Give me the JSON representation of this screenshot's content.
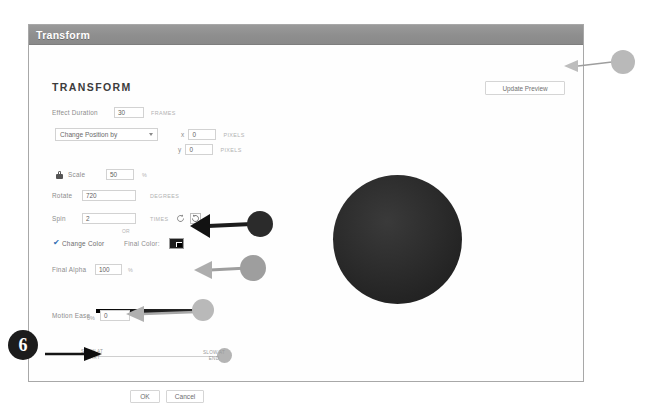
{
  "window": {
    "title": "Transform",
    "section_heading": "TRANSFORM",
    "update_preview_label": "Update Preview"
  },
  "fields": {
    "effect_duration": {
      "label": "Effect Duration",
      "value": "30",
      "unit": "FRAMES"
    },
    "change_position": {
      "dropdown_label": "Change Position by",
      "dropdown_icon": "chevron-down-icon",
      "x": {
        "axis": "x",
        "value": "0",
        "unit": "PIXELS"
      },
      "y": {
        "axis": "y",
        "value": "0",
        "unit": "PIXELS"
      }
    },
    "scale": {
      "lock_icon": "lock-icon",
      "label": "Scale",
      "value": "50",
      "unit": "%"
    },
    "rotate": {
      "label": "Rotate",
      "value": "720",
      "unit": "DEGREES"
    },
    "or_text": "OR",
    "spin": {
      "label": "Spin",
      "value": "2",
      "unit": "TIMES",
      "ccw_icon": "rotate-counterclockwise-icon",
      "cw_icon": "rotate-clockwise-icon"
    },
    "change_color": {
      "checkbox_checked": true,
      "checkbox_glyph": "✔",
      "label": "Change Color",
      "final_color_label": "Final Color:",
      "swatch_color": "#1e1e1e"
    },
    "final_alpha": {
      "label": "Final Alpha",
      "value": "100",
      "unit": "%",
      "slider_min_label": "0%"
    },
    "motion_ease": {
      "label": "Motion Ease",
      "value": "0",
      "slow_start_label": "SLOW AT\nSTART",
      "slow_end_label": "SLOW AT\nEND"
    }
  },
  "buttons": {
    "ok": "OK",
    "cancel": "Cancel"
  },
  "annotations": {
    "step_number": "6"
  },
  "colors": {
    "titlebar": "#8e8e8e",
    "swatch": "#1e1e1e",
    "preview_object": "#2c2c2c",
    "annotation_dark": "#2b2b2b",
    "annotation_light": "#b9b9b9"
  }
}
